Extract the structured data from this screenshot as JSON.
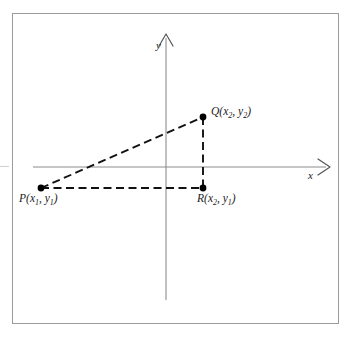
{
  "figure": {
    "type": "geometry-diagram",
    "background_color": "#ffffff",
    "border_color": "#9a9a9a",
    "stroke_color": "#1a1a1a",
    "axis_color": "#8c8c8c"
  },
  "axes": {
    "x": {
      "name": "x-axis",
      "label": "x",
      "label_style": "italic",
      "arrow": "right",
      "y_pixel": 167,
      "x_start": 33,
      "x_end": 331
    },
    "y": {
      "name": "y-axis",
      "label": "y",
      "label_style": "italic",
      "arrow": "up",
      "x_pixel": 166,
      "y_start": 33,
      "y_end": 300
    },
    "origin": {
      "x": 166,
      "y": 167
    }
  },
  "points": [
    {
      "id": "P",
      "name": "point-p",
      "letter": "P",
      "label": "P(x1, y1)",
      "coord_x_var": "x",
      "coord_x_sub": "1",
      "coord_y_var": "y",
      "coord_y_sub": "1",
      "px": 41,
      "py": 188,
      "marker": "filled-dot"
    },
    {
      "id": "Q",
      "name": "point-q",
      "letter": "Q",
      "label": "Q(x2, y2)",
      "coord_x_var": "x",
      "coord_x_sub": "2",
      "coord_y_var": "y",
      "coord_y_sub": "2",
      "px": 203,
      "py": 117,
      "marker": "filled-dot"
    },
    {
      "id": "R",
      "name": "point-r",
      "letter": "R",
      "label": "R(x2, y1)",
      "coord_x_var": "x",
      "coord_x_sub": "2",
      "coord_y_var": "y",
      "coord_y_sub": "1",
      "px": 203,
      "py": 188,
      "marker": "filled-dot"
    }
  ],
  "segments": [
    {
      "name": "segment-pq",
      "from": "P",
      "to": "Q",
      "style": "dashed",
      "role": "hypotenuse"
    },
    {
      "name": "segment-pr",
      "from": "P",
      "to": "R",
      "style": "dashed",
      "role": "horizontal-leg"
    },
    {
      "name": "segment-qr",
      "from": "Q",
      "to": "R",
      "style": "dashed",
      "role": "vertical-leg"
    }
  ]
}
